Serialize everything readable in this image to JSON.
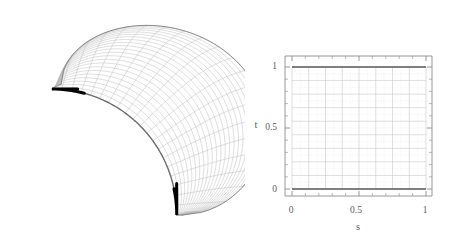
{
  "figure": {
    "title": "",
    "background_color": "#ffffff",
    "panels": [
      {
        "name": "surface-panel",
        "label": "",
        "description": "3D wireframe parametric surface with thick black boundary curve"
      },
      {
        "name": "parameter-domain-panel",
        "label": "",
        "description": "2D parameter domain square grid"
      }
    ]
  },
  "left_plot": {
    "name": "surface-3d",
    "mesh_color": "#b8b8b8",
    "outline_color": "#808080",
    "curve_color": "#000000",
    "curve_name": "boundary-curve",
    "u_divisions": 20,
    "v_divisions": 22
  },
  "chart_data": {
    "type": "line",
    "title": "",
    "xlabel": "s",
    "ylabel": "t",
    "xlim": [
      0,
      1
    ],
    "ylim": [
      0,
      1
    ],
    "xticks": [
      0,
      0.5,
      1
    ],
    "yticks": [
      0,
      0.5,
      1
    ],
    "xticklabels": [
      "0",
      "0.5",
      "1"
    ],
    "yticklabels": [
      "0",
      "0.5",
      "1"
    ],
    "grid": true,
    "grid_color": "#c9c9c9",
    "minor_grid_color": "#e0e0e0",
    "grid_cols": 8,
    "grid_rows": 9,
    "minor_per_cell": 2,
    "legend": null,
    "axis_color": "#8c8c8c",
    "series": [
      {
        "name": "t-equals-one-boundary",
        "color": "#5a5a5a",
        "x": [
          0,
          1
        ],
        "values": [
          1,
          1
        ]
      },
      {
        "name": "t-equals-zero-boundary",
        "color": "#5a5a5a",
        "x": [
          0,
          1
        ],
        "values": [
          0,
          0
        ]
      }
    ]
  }
}
